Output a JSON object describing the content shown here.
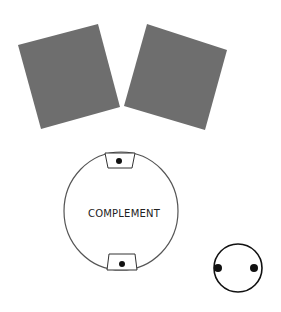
{
  "diagram": {
    "colors": {
      "square_fill": "#6e6e6e",
      "stroke": "#555555",
      "dark_stroke": "#111111",
      "dot": "#111111",
      "background": "#ffffff"
    },
    "squares": [
      {
        "name": "left-square",
        "points": "18,45 98,24 120,107 41,129"
      },
      {
        "name": "right-square",
        "points": "147,24 227,50 205,130 124,106"
      }
    ],
    "complement_circle": {
      "label": "COMPLEMENT",
      "cx": 121,
      "cy": 211,
      "rx": 57,
      "ry": 59,
      "top_tab": {
        "points": "105,153 135,153 132,168 108,168",
        "dot": {
          "cx": 119,
          "cy": 161,
          "r": 3
        }
      },
      "bottom_tab": {
        "points": "109,254 135,254 137,270 107,270",
        "dot": {
          "cx": 122,
          "cy": 264,
          "r": 3
        }
      }
    },
    "small_circle": {
      "cx": 238,
      "cy": 268,
      "r": 24,
      "dots": [
        {
          "cx": 218,
          "cy": 268,
          "r": 4
        },
        {
          "cx": 254,
          "cy": 268,
          "r": 4
        }
      ]
    }
  }
}
